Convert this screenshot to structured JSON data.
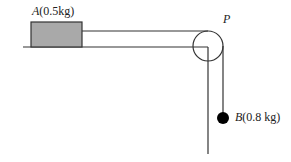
{
  "block_a": {
    "name": "A",
    "mass": "(0.5kg)",
    "fill": "#a9a9a9"
  },
  "ball_b": {
    "name": "B",
    "mass": "(0.8 kg)",
    "fill": "#000000"
  },
  "pulley": {
    "name": "P"
  }
}
